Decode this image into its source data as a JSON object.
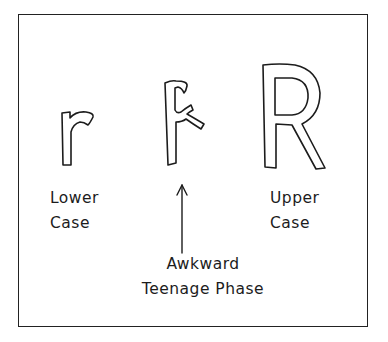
{
  "comic": {
    "letters": [
      {
        "id": "lowercase-r",
        "glyph": "r"
      },
      {
        "id": "awkward-r",
        "glyph": "r/R hybrid"
      },
      {
        "id": "uppercase-R",
        "glyph": "R"
      }
    ],
    "labels": {
      "lower": [
        "Lower",
        "Case"
      ],
      "awkward": [
        "Awkward",
        "Teenage Phase"
      ],
      "upper": [
        "Upper",
        "Case"
      ]
    },
    "colors": {
      "ink": "#1c1c1c",
      "paper": "#ffffff"
    }
  }
}
